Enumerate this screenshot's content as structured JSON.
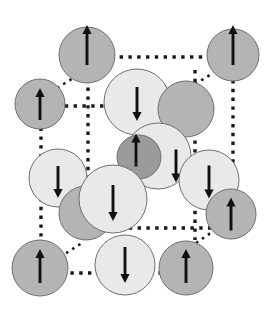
{
  "figure": {
    "width": 279,
    "height": 318,
    "background_color": "#ffffff"
  },
  "palette": {
    "atom_light": "#e9e9e9",
    "atom_medium": "#b4b4b4",
    "atom_dark": "#9a9a9a",
    "atom_outline": "#6f6f6f",
    "bond_color": "#1a1a1a",
    "arrow_color": "#111111"
  },
  "legend": {
    "spin_up_label": "spin up",
    "spin_down_label": "spin down",
    "atom_light_label": "large light sphere",
    "atom_medium_label": "medium gray sphere",
    "atom_dark_label": "small dark sphere"
  },
  "bonds": [
    {
      "name": "bond-top-back-horizontal",
      "x1": 102,
      "y1": 57,
      "x2": 210,
      "y2": 57,
      "style": "dotted",
      "width": 3.4,
      "dash": "3.4 5.4"
    },
    {
      "name": "bond-top-left-diagonal",
      "x1": 57,
      "y1": 88,
      "x2": 80,
      "y2": 74,
      "style": "dotted",
      "width": 2.6,
      "dash": "2.6 4.6"
    },
    {
      "name": "bond-top-right-diagonal",
      "x1": 189,
      "y1": 88,
      "x2": 213,
      "y2": 73,
      "style": "dotted",
      "width": 2.6,
      "dash": "2.6 4.6"
    },
    {
      "name": "bond-mid-front-horizontal",
      "x1": 56,
      "y1": 106,
      "x2": 188,
      "y2": 106,
      "style": "dotted",
      "width": 3.4,
      "dash": "3.4 5.4"
    },
    {
      "name": "bond-back-left-vertical",
      "x1": 88,
      "y1": 70,
      "x2": 88,
      "y2": 240,
      "style": "dotted",
      "width": 3.4,
      "dash": "3.4 5.4"
    },
    {
      "name": "bond-back-right-vertical",
      "x1": 195,
      "y1": 70,
      "x2": 195,
      "y2": 240,
      "style": "dotted",
      "width": 3.4,
      "dash": "3.4 5.4"
    },
    {
      "name": "bond-front-left-vertical",
      "x1": 41,
      "y1": 110,
      "x2": 41,
      "y2": 258,
      "style": "dotted",
      "width": 3.4,
      "dash": "3.4 5.4"
    },
    {
      "name": "bond-front-right-vertical",
      "x1": 233,
      "y1": 80,
      "x2": 233,
      "y2": 222,
      "style": "dotted",
      "width": 3.4,
      "dash": "3.4 5.4"
    },
    {
      "name": "bond-mid-back-horizontal",
      "x1": 120,
      "y1": 228,
      "x2": 215,
      "y2": 228,
      "style": "dotted",
      "width": 3.4,
      "dash": "3.4 5.4"
    },
    {
      "name": "bond-bottom-left-diagonal",
      "x1": 60,
      "y1": 257,
      "x2": 82,
      "y2": 243,
      "style": "dotted",
      "width": 2.6,
      "dash": "2.6 4.6"
    },
    {
      "name": "bond-bottom-right-diagonal",
      "x1": 196,
      "y1": 243,
      "x2": 218,
      "y2": 228,
      "style": "dotted",
      "width": 2.6,
      "dash": "2.6 4.6"
    },
    {
      "name": "bond-bottom-front-horizontal",
      "x1": 44,
      "y1": 273,
      "x2": 196,
      "y2": 273,
      "style": "dotted",
      "width": 3.4,
      "dash": "3.4 5.4"
    }
  ],
  "atoms": [
    {
      "name": "atom-top-back-left",
      "cx": 87,
      "cy": 55,
      "r": 28,
      "shade": "medium",
      "spin": "up",
      "arrow_length": 40,
      "arrow_offset_x": 0,
      "arrow_offset_y": -10
    },
    {
      "name": "atom-top-back-right",
      "cx": 233,
      "cy": 55,
      "r": 26,
      "shade": "medium",
      "spin": "up",
      "arrow_length": 40,
      "arrow_offset_x": 0,
      "arrow_offset_y": -10
    },
    {
      "name": "atom-mid-front-left",
      "cx": 40,
      "cy": 104,
      "r": 25,
      "shade": "medium",
      "spin": "up",
      "arrow_length": 32,
      "arrow_offset_x": 0,
      "arrow_offset_y": 0
    },
    {
      "name": "atom-upper-center-light",
      "cx": 137,
      "cy": 102,
      "r": 33,
      "shade": "light",
      "spin": "down",
      "arrow_length": 34,
      "arrow_offset_x": 0,
      "arrow_offset_y": 2
    },
    {
      "name": "atom-upper-right-medium",
      "cx": 186,
      "cy": 109,
      "r": 28,
      "shade": "medium",
      "spin": "none",
      "arrow_length": 0,
      "arrow_offset_x": 0,
      "arrow_offset_y": 0
    },
    {
      "name": "atom-center-light",
      "cx": 158,
      "cy": 156,
      "r": 33,
      "shade": "light",
      "spin": "down",
      "arrow_length": 33,
      "arrow_offset_x": 18,
      "arrow_offset_y": 10
    },
    {
      "name": "atom-body-center-dark",
      "cx": 139,
      "cy": 157,
      "r": 22,
      "shade": "dark",
      "spin": "up",
      "arrow_length": 33,
      "arrow_offset_x": -3,
      "arrow_offset_y": -7
    },
    {
      "name": "atom-mid-left-light",
      "cx": 58,
      "cy": 178,
      "r": 29,
      "shade": "light",
      "spin": "down",
      "arrow_length": 32,
      "arrow_offset_x": 0,
      "arrow_offset_y": 4
    },
    {
      "name": "atom-mid-right-light",
      "cx": 209,
      "cy": 180,
      "r": 30,
      "shade": "light",
      "spin": "down",
      "arrow_length": 33,
      "arrow_offset_x": 0,
      "arrow_offset_y": 2
    },
    {
      "name": "atom-lower-left-medium",
      "cx": 86,
      "cy": 213,
      "r": 27,
      "shade": "medium",
      "spin": "none",
      "arrow_length": 0,
      "arrow_offset_x": 0,
      "arrow_offset_y": 0
    },
    {
      "name": "atom-lower-center-light",
      "cx": 113,
      "cy": 199,
      "r": 34,
      "shade": "light",
      "spin": "down",
      "arrow_length": 36,
      "arrow_offset_x": 0,
      "arrow_offset_y": 4
    },
    {
      "name": "atom-mid-right-medium",
      "cx": 231,
      "cy": 214,
      "r": 25,
      "shade": "medium",
      "spin": "up",
      "arrow_length": 33,
      "arrow_offset_x": 0,
      "arrow_offset_y": 0
    },
    {
      "name": "atom-bottom-front-left",
      "cx": 40,
      "cy": 268,
      "r": 28,
      "shade": "medium",
      "spin": "up",
      "arrow_length": 34,
      "arrow_offset_x": 0,
      "arrow_offset_y": -2
    },
    {
      "name": "atom-bottom-center-light",
      "cx": 125,
      "cy": 265,
      "r": 30,
      "shade": "light",
      "spin": "down",
      "arrow_length": 36,
      "arrow_offset_x": 0,
      "arrow_offset_y": 0
    },
    {
      "name": "atom-bottom-front-right",
      "cx": 186,
      "cy": 268,
      "r": 27,
      "shade": "medium",
      "spin": "up",
      "arrow_length": 34,
      "arrow_offset_x": 0,
      "arrow_offset_y": -2
    }
  ]
}
